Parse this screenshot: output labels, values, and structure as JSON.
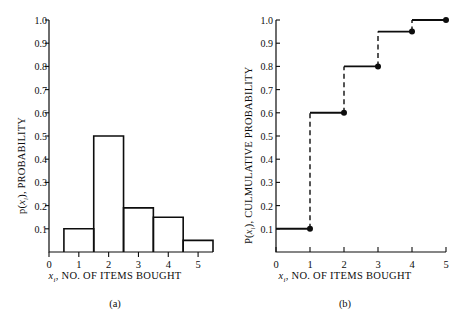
{
  "figure": {
    "background": "#ffffff",
    "ink": "#0d0d0d"
  },
  "panel_a": {
    "caption": "(a)",
    "ylabel_prefix": "p(",
    "ylabel_var": "x",
    "ylabel_sub": "i",
    "ylabel_suffix": "), PROBABILITY",
    "xlabel_var": "x",
    "xlabel_sub": "i",
    "xlabel_suffix": ", NO.  OF  ITEMS  BOUGHT",
    "yticks": [
      "1.0",
      "0.9",
      "0.8",
      "0.7",
      "0.6",
      "0.5",
      "0.4",
      "0.3",
      "0.2",
      "0.1"
    ],
    "xticks": [
      "0",
      "1",
      "2",
      "3",
      "4",
      "5"
    ]
  },
  "panel_b": {
    "caption": "(b)",
    "ylabel_prefix": "P(",
    "ylabel_var": "x",
    "ylabel_sub": "i",
    "ylabel_suffix": "), CULMULATIVE PROBABILITY",
    "xlabel_var": "x",
    "xlabel_sub": "i",
    "xlabel_suffix": ", NO.  OF  ITEMS  BOUGHT",
    "yticks": [
      "1.0",
      "0.9",
      "0.8",
      "0.7",
      "0.6",
      "0.5",
      "0.4",
      "0.3",
      "0.2",
      "0.1"
    ],
    "xticks": [
      "0",
      "1",
      "2",
      "3",
      "4",
      "5"
    ]
  },
  "chart_data": [
    {
      "type": "bar",
      "panel": "(a)",
      "title": "",
      "xlabel": "x_i, NO. OF ITEMS BOUGHT",
      "ylabel": "p(x_i), PROBABILITY",
      "categories": [
        1,
        2,
        3,
        4,
        5
      ],
      "values": [
        0.1,
        0.5,
        0.19,
        0.15,
        0.05
      ],
      "bar_width": 1,
      "bar_alignment": "centered-on-category",
      "xlim": [
        0,
        5.5
      ],
      "ylim": [
        0,
        1.0
      ],
      "ytick_values": [
        0.1,
        0.2,
        0.3,
        0.4,
        0.5,
        0.6,
        0.7,
        0.8,
        0.9,
        1.0
      ],
      "xtick_values": [
        0,
        1,
        2,
        3,
        4,
        5
      ],
      "grid": false,
      "legend": "none",
      "tick_direction": "out",
      "spines": [
        "left",
        "bottom"
      ],
      "bar_fill": "none",
      "bar_edge_color": "#0d0d0d"
    },
    {
      "type": "line",
      "subtype": "step-cdf",
      "panel": "(b)",
      "title": "",
      "xlabel": "x_i, NO. OF ITEMS BOUGHT",
      "ylabel": "P(x_i), CULMULATIVE PROBABILITY",
      "x": [
        1,
        2,
        3,
        4,
        5
      ],
      "values": [
        0.1,
        0.6,
        0.8,
        0.95,
        1.0
      ],
      "step_segments": [
        {
          "x_start": 0,
          "x_end": 1,
          "y": 0.1
        },
        {
          "x_start": 1,
          "x_end": 2,
          "y": 0.6
        },
        {
          "x_start": 2,
          "x_end": 3,
          "y": 0.8
        },
        {
          "x_start": 3,
          "x_end": 4,
          "y": 0.95
        },
        {
          "x_start": 4,
          "x_end": 5,
          "y": 1.0
        }
      ],
      "risers": [
        {
          "x": 1,
          "y_from": 0.1,
          "y_to": 0.6
        },
        {
          "x": 2,
          "y_from": 0.6,
          "y_to": 0.8
        },
        {
          "x": 3,
          "y_from": 0.8,
          "y_to": 0.95
        },
        {
          "x": 4,
          "y_from": 0.95,
          "y_to": 1.0
        }
      ],
      "markers": [
        {
          "x": 1,
          "y": 0.1
        },
        {
          "x": 2,
          "y": 0.6
        },
        {
          "x": 3,
          "y": 0.8
        },
        {
          "x": 4,
          "y": 0.95
        },
        {
          "x": 5,
          "y": 1.0
        }
      ],
      "marker_style": "filled-circle",
      "tread_style": "solid",
      "riser_style": "dashed",
      "xlim": [
        0,
        5
      ],
      "ylim": [
        0,
        1.0
      ],
      "ytick_values": [
        0.1,
        0.2,
        0.3,
        0.4,
        0.5,
        0.6,
        0.7,
        0.8,
        0.9,
        1.0
      ],
      "xtick_values": [
        0,
        1,
        2,
        3,
        4,
        5
      ],
      "grid": false,
      "legend": "none",
      "tick_direction": "in",
      "spines": [
        "left",
        "bottom"
      ],
      "line_color": "#0d0d0d"
    }
  ]
}
